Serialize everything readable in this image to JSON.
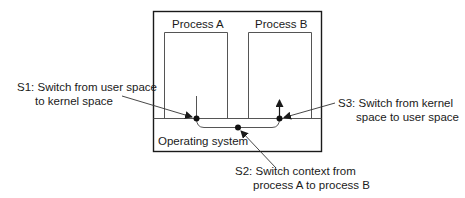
{
  "diagram": {
    "processes": [
      {
        "label": "Process A"
      },
      {
        "label": "Process B"
      }
    ],
    "os_label": "Operating system",
    "steps": [
      {
        "id": "S1",
        "line1": "S1: Switch from user space",
        "line2": "to kernel space"
      },
      {
        "id": "S2",
        "line1": "S2: Switch context from",
        "line2": "process A to process B"
      },
      {
        "id": "S3",
        "line1": "S3: Switch from kernel",
        "line2": "space to user space"
      }
    ],
    "colors": {
      "stroke": "#1a1a1a",
      "thin_stroke": "#555555",
      "background": "#ffffff"
    }
  }
}
